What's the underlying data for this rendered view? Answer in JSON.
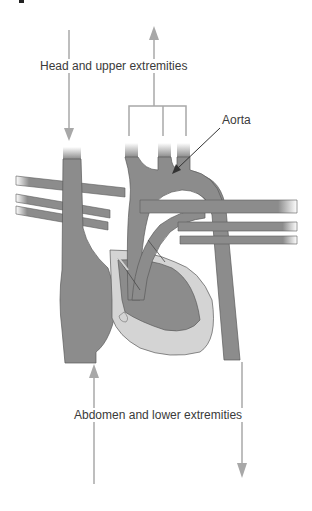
{
  "diagram": {
    "type": "fetal circulation schematic",
    "labels": {
      "top": "Head and upper extremities",
      "aorta": "Aorta",
      "bottom": "Abdomen and lower extremities"
    },
    "colors": {
      "vessel": "#8c8c8c",
      "vessel_outline": "#5a5a5a",
      "ventricle_light": "#d4d4d4",
      "arrow": "#a8a8a8",
      "pointer": "#333333",
      "text": "#3a3a3a"
    }
  }
}
